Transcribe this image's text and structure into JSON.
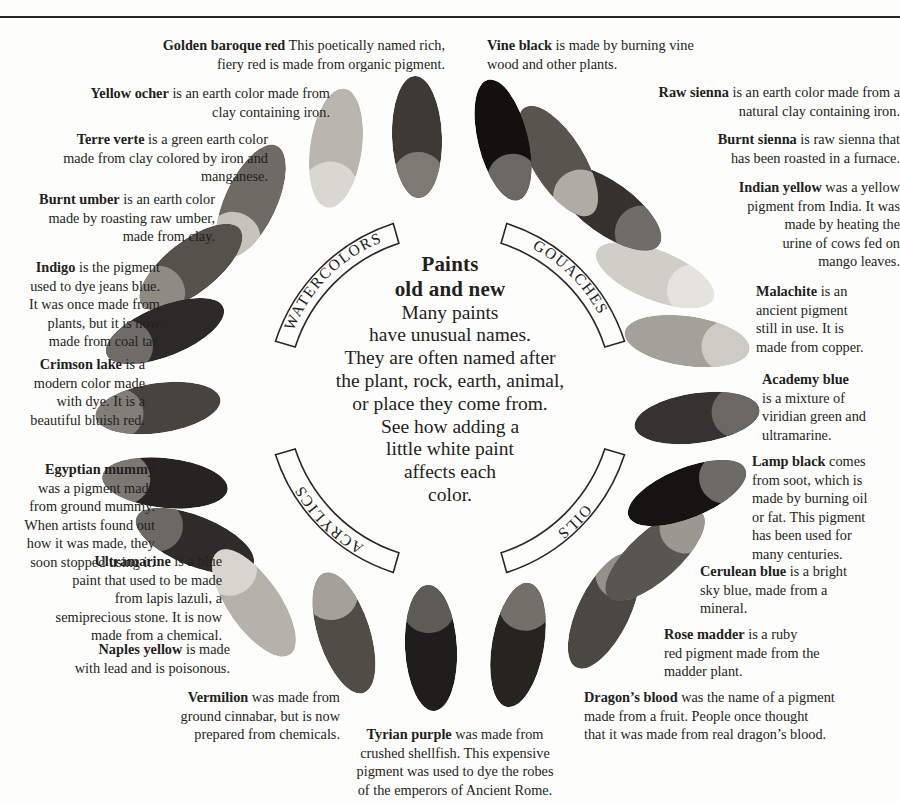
{
  "center": {
    "title_line1": "Paints",
    "title_line2": "old and new",
    "body": "Many paints have unusual names. They are often named after the plant, rock, earth, animal, or place they come from. See how adding a little white paint affects each color.",
    "body_lines": [
      "Many paints",
      "have unusual names.",
      "They are often named after",
      "the plant, rock, earth, animal,",
      "or place they come from.",
      "See how adding a",
      "little white paint",
      "affects each",
      "color."
    ]
  },
  "ring": {
    "segments": [
      {
        "label": "WATERCOLORS",
        "id": "watercolors"
      },
      {
        "label": "GOUACHES",
        "id": "gouaches"
      },
      {
        "label": "OILS",
        "id": "oils"
      },
      {
        "label": "ACRYLICS",
        "id": "acrylics"
      }
    ]
  },
  "colors": {
    "ink": "#231f20",
    "rule": "#2a2722",
    "paper": "#fdfdfc"
  },
  "paints": [
    {
      "name": "Golden baroque red",
      "text": "This poetically named rich, fiery red is made from organic pigment.",
      "lines": [
        "<b>Golden baroque red</b> This poetically named rich,",
        "fiery red is made from organic pigment."
      ],
      "dark": "#3d3934",
      "tint": "#7d7a74",
      "category": "watercolors"
    },
    {
      "name": "Yellow ocher",
      "text": "is an earth color made from clay containing iron.",
      "lines": [
        "<b>Yellow ocher</b> is an earth color made from",
        "clay containing iron."
      ],
      "dark": "#b9b7ad",
      "tint": "#d8d7d0",
      "category": "watercolors"
    },
    {
      "name": "Terre verte",
      "text": "is a green earth color made from clay colored by iron and manganese.",
      "lines": [
        "<b>Terre verte</b> is a green earth color",
        "made from clay colored by iron and",
        "manganese."
      ],
      "dark": "#6d6b63",
      "tint": "#c6c4ba",
      "category": "watercolors"
    },
    {
      "name": "Burnt umber",
      "text": "is an earth color made by roasting raw umber, made from clay.",
      "lines": [
        "<b>Burnt umber</b> is an earth color",
        "made by roasting raw umber,",
        "made from clay."
      ],
      "dark": "#55514b",
      "tint": "#8e8b83",
      "category": "watercolors"
    },
    {
      "name": "Indigo",
      "text": "is the pigment used to dye jeans blue. It was once made from plants, but it is now made from coal tar.",
      "lines": [
        "<b>Indigo</b> is the pigment",
        "used to dye jeans blue.",
        "It was once made from",
        "plants, but it is now",
        "made from coal tar."
      ],
      "dark": "#2b2a28",
      "tint": "#6f6d68",
      "category": "acrylics"
    },
    {
      "name": "Crimson lake",
      "text": "is a modern color made with dye. It is a beautiful bluish red.",
      "lines": [
        "<b>Crimson lake</b> is a",
        "modern color made",
        "with dye. It is a",
        "beautiful bluish red."
      ],
      "dark": "#474440",
      "tint": "#817e78",
      "category": "acrylics"
    },
    {
      "name": "Egyptian mummy",
      "text": "was a pigment made from ground mummy. When artists found out how it was made, they soon stopped using it.",
      "lines": [
        "<b>Egyptian mummy</b>",
        "was a pigment made",
        "from ground mummy.",
        "When artists found out",
        "how it was made, they",
        "soon stopped using it."
      ],
      "dark": "#262421",
      "tint": "#7b7872",
      "category": "acrylics"
    },
    {
      "name": "Ultramarine",
      "text": "is a blue paint that used to be made from lapis lazuli, a semiprecious stone. It is now made from a chemical.",
      "lines": [
        "<b>Ultramarine</b> is a blue",
        "paint that used to be made",
        "from lapis lazuli, a",
        "semiprecious stone. It is now",
        "made from a chemical."
      ],
      "dark": "#2e2c29",
      "tint": "#6b6963",
      "category": "acrylics"
    },
    {
      "name": "Naples yellow",
      "text": "is made with lead and is poisonous.",
      "lines": [
        "<b>Naples yellow</b> is made",
        "with lead and is poisonous."
      ],
      "dark": "#b5b3a9",
      "tint": "#d6d5ce",
      "category": "acrylics"
    },
    {
      "name": "Vermilion",
      "text": "was made from ground cinnabar, but is now prepared from chemicals.",
      "lines": [
        "<b>Vermilion</b> was made from",
        "ground cinnabar, but is now",
        "prepared from chemicals."
      ],
      "dark": "#504d47",
      "tint": "#a3a199",
      "category": "acrylics"
    },
    {
      "name": "Tyrian purple",
      "text": "was made from crushed shellfish. This expensive pigment was used to dye the robes of the emperors of Ancient Rome.",
      "lines": [
        "<b>Tyrian purple</b> was made from",
        "crushed shellfish. This expensive",
        "pigment was used to dye the robes",
        "of the emperors of Ancient Rome."
      ],
      "dark": "#201e1c",
      "tint": "#5e5c57",
      "category": "oils"
    },
    {
      "name": "Dragon's blood",
      "text": "was the name of a pigment made from a fruit. People once thought that it was made from real dragon's blood.",
      "lines": [
        "<b>Dragon’s blood</b> was the name of a pigment",
        "made from a fruit. People once thought",
        "that it was made from real dragon’s blood."
      ],
      "dark": "#26241f",
      "tint": "#727069",
      "category": "oils"
    },
    {
      "name": "Rose madder",
      "text": "is a ruby red pigment made from the madder plant.",
      "lines": [
        "<b>Rose madder</b> is a ruby",
        "red pigment made from the",
        "madder plant."
      ],
      "dark": "#4b4843",
      "tint": "#93918a",
      "category": "oils"
    },
    {
      "name": "Cerulean blue",
      "text": "is a bright sky blue, made from a mineral.",
      "lines": [
        "<b>Cerulean blue</b> is a bright",
        "sky blue, made from a",
        "mineral."
      ],
      "dark": "#585650",
      "tint": "#9b998f",
      "category": "oils"
    },
    {
      "name": "Lamp black",
      "text": "comes from soot, which is made by burning oil or fat. This pigment has been used for many centuries.",
      "lines": [
        "<b>Lamp black</b> comes",
        "from soot, which is",
        "made by burning oil",
        "or fat. This pigment",
        "has been used for",
        "many centuries."
      ],
      "dark": "#161412",
      "tint": "#6d6b66",
      "category": "gouaches"
    },
    {
      "name": "Academy blue",
      "text": "is a mixture of viridian green and ultramarine.",
      "lines": [
        "<b>Academy blue</b>",
        "is a mixture of",
        "viridian green and",
        "ultramarine."
      ],
      "dark": "#35332f",
      "tint": "#6a6862",
      "category": "gouaches"
    },
    {
      "name": "Malachite",
      "text": "is an ancient pigment still in use. It is made from copper.",
      "lines": [
        "<b>Malachite</b> is an",
        "ancient pigment",
        "still in use. It is",
        "made from copper."
      ],
      "dark": "#a3a298",
      "tint": "#cdccc4",
      "category": "gouaches"
    },
    {
      "name": "Indian yellow",
      "text": "was a yellow pigment from India. It was made by heating the urine of cows fed on mango leaves.",
      "lines": [
        "<b>Indian yellow</b> was a yellow",
        "pigment from India. It was",
        "made by heating the",
        "urine of cows fed on",
        "mango leaves."
      ],
      "dark": "#cfcec7",
      "tint": "#e4e3de",
      "category": "gouaches"
    },
    {
      "name": "Burnt sienna",
      "text": "is raw sienna that has been roasted in a furnace.",
      "lines": [
        "<b>Burnt sienna</b> is raw sienna that",
        "has been roasted in a furnace."
      ],
      "dark": "#35322e",
      "tint": "#6f6d67",
      "category": "gouaches"
    },
    {
      "name": "Raw sienna",
      "text": "is an earth color made from a natural clay containing iron.",
      "lines": [
        "<b>Raw sienna</b> is an earth color made from a",
        "natural clay containing iron."
      ],
      "dark": "#58554f",
      "tint": "#aeaca3",
      "category": "gouaches"
    },
    {
      "name": "Vine black",
      "text": "is made by burning vine wood and other plants.",
      "lines": [
        "<b>Vine black</b> is made by burning vine",
        "wood and other plants."
      ],
      "dark": "#121110",
      "tint": "#6a6862",
      "category": "gouaches"
    }
  ]
}
